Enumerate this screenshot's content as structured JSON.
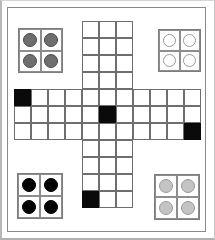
{
  "figure": {
    "width": 215,
    "height": 240,
    "background_color": "#ffffff"
  },
  "frame": {
    "outer_border_color": "#b8b8b8",
    "inner_border_color": "#8a8a8a"
  },
  "board": {
    "shape": "plus",
    "arm_width_cells": 3,
    "span_cells": 11,
    "cell_size_px": 17,
    "grid_line_color": "#6e6e6e",
    "empty_cell_color": "#ffffff",
    "filled_cell_color": "#0a0a0a",
    "filled_cells": [
      {
        "row": 0,
        "col": 7,
        "label": "top-arm-right"
      },
      {
        "row": 4,
        "col": 0,
        "label": "left-arm-top"
      },
      {
        "row": 5,
        "col": 5,
        "label": "center"
      },
      {
        "row": 6,
        "col": 10,
        "label": "right-arm-bottom"
      },
      {
        "row": 10,
        "col": 4,
        "label": "bottom-arm-left"
      }
    ]
  },
  "token_groups": [
    {
      "id": "top-left",
      "position": "top-left",
      "rows": 2,
      "cols": 2,
      "count": 4,
      "token_color": "#6e6e6e",
      "token_style": "dark-gray",
      "tokens": [
        "dark-gray",
        "dark-gray",
        "dark-gray",
        "dark-gray"
      ]
    },
    {
      "id": "top-right",
      "position": "top-right",
      "rows": 2,
      "cols": 2,
      "count": 4,
      "token_color": "#ffffff",
      "token_style": "white",
      "tokens": [
        "white",
        "white",
        "white",
        "white"
      ]
    },
    {
      "id": "bottom-left",
      "position": "bottom-left",
      "rows": 2,
      "cols": 2,
      "count": 4,
      "token_color": "#000000",
      "token_style": "black",
      "tokens": [
        "black",
        "black",
        "black",
        "black"
      ]
    },
    {
      "id": "bottom-right",
      "position": "bottom-right",
      "rows": 2,
      "cols": 2,
      "count": 4,
      "token_color": "#c4c4c4",
      "token_style": "light-gray",
      "tokens": [
        "light-gray",
        "light-gray",
        "light-gray",
        "light-gray"
      ]
    }
  ]
}
